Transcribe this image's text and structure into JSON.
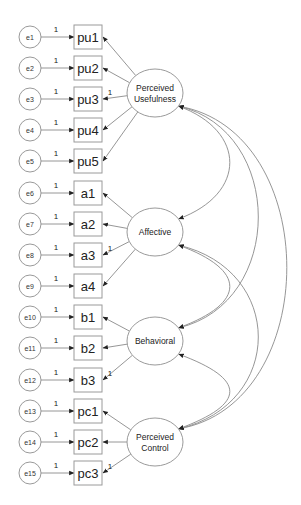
{
  "diagram": {
    "title": "",
    "latents": [
      {
        "id": "PU",
        "lines": [
          "Perceived",
          "Usefulness"
        ],
        "cx": 155,
        "cy": 93
      },
      {
        "id": "AF",
        "lines": [
          "Affective"
        ],
        "cx": 155,
        "cy": 232
      },
      {
        "id": "BE",
        "lines": [
          "Behavioral"
        ],
        "cx": 155,
        "cy": 341
      },
      {
        "id": "PC",
        "lines": [
          "Perceived",
          "Control"
        ],
        "cx": 155,
        "cy": 442
      }
    ],
    "indicators": [
      {
        "label": "pu1",
        "error": "e1",
        "latent": "PU",
        "fixed": false
      },
      {
        "label": "pu2",
        "error": "e2",
        "latent": "PU",
        "fixed": false
      },
      {
        "label": "pu3",
        "error": "e3",
        "latent": "PU",
        "fixed": true
      },
      {
        "label": "pu4",
        "error": "e4",
        "latent": "PU",
        "fixed": false
      },
      {
        "label": "pu5",
        "error": "e5",
        "latent": "PU",
        "fixed": false
      },
      {
        "label": "a1",
        "error": "e6",
        "latent": "AF",
        "fixed": false
      },
      {
        "label": "a2",
        "error": "e7",
        "latent": "AF",
        "fixed": false
      },
      {
        "label": "a3",
        "error": "e8",
        "latent": "AF",
        "fixed": true
      },
      {
        "label": "a4",
        "error": "e9",
        "latent": "AF",
        "fixed": false
      },
      {
        "label": "b1",
        "error": "e10",
        "latent": "BE",
        "fixed": false
      },
      {
        "label": "b2",
        "error": "e11",
        "latent": "BE",
        "fixed": false
      },
      {
        "label": "b3",
        "error": "e12",
        "latent": "BE",
        "fixed": true
      },
      {
        "label": "pc1",
        "error": "e13",
        "latent": "PC",
        "fixed": false
      },
      {
        "label": "pc2",
        "error": "e14",
        "latent": "PC",
        "fixed": false
      },
      {
        "label": "pc3",
        "error": "e15",
        "latent": "PC",
        "fixed": true
      }
    ],
    "error_weight": "1",
    "loading_weight": "1",
    "covariances": [
      [
        "PU",
        "AF"
      ],
      [
        "PU",
        "BE"
      ],
      [
        "PU",
        "PC"
      ],
      [
        "AF",
        "BE"
      ],
      [
        "AF",
        "PC"
      ],
      [
        "BE",
        "PC"
      ]
    ],
    "colors": {
      "stroke": "#9a9a9a",
      "text": "#222222",
      "background": "#ffffff"
    }
  }
}
